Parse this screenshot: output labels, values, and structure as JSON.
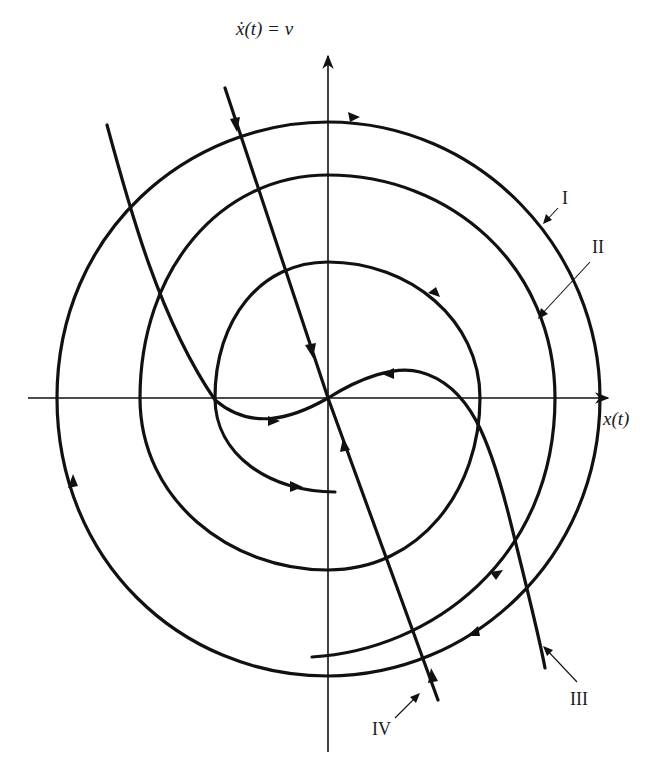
{
  "diagram": {
    "type": "phase-portrait",
    "axes": {
      "horizontal_label": "x(t)",
      "vertical_label": "ẋ(t) = v"
    },
    "trajectory_labels": {
      "I": "I",
      "II": "II",
      "III": "III",
      "IV": "IV"
    },
    "trajectories": [
      {
        "id": "I",
        "description": "outer closed orbit, clockwise"
      },
      {
        "id": "II",
        "description": "inward spiral, counterclockwise"
      },
      {
        "id": "III",
        "description": "S-shaped separatrix through origin"
      },
      {
        "id": "IV",
        "description": "straight line through origin"
      }
    ],
    "colors": {
      "ink": "#111111",
      "background": "#ffffff"
    }
  }
}
